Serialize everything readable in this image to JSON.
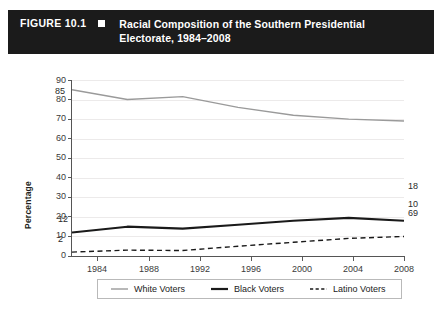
{
  "header": {
    "figure_number": "FIGURE 10.1",
    "bullet_icon": "square-bullet-icon",
    "title_line1": "Racial Composition of the Southern Presidential",
    "title_line2": "Electorate, 1984–2008",
    "bar_color": "#1b1b1b",
    "text_color": "#ffffff"
  },
  "chart_data": {
    "type": "line",
    "title": "Racial Composition of the Southern Presidential Electorate, 1984–2008",
    "xlabel": "",
    "ylabel": "Percentage",
    "x": [
      "1984",
      "1988",
      "1992",
      "1996",
      "2000",
      "2004",
      "2008"
    ],
    "categories": [
      "1984",
      "1988",
      "1992",
      "1996",
      "2000",
      "2004",
      "2008"
    ],
    "ylim": [
      0,
      90
    ],
    "yticks": [
      0,
      10,
      20,
      30,
      40,
      50,
      60,
      70,
      80,
      90
    ],
    "grid": true,
    "legend_position": "bottom",
    "series": [
      {
        "name": "White Voters",
        "values": [
          85,
          80,
          81.5,
          76,
          72,
          70,
          69
        ],
        "color": "#9a9a9a",
        "style": "solid",
        "width": 1.4,
        "point_labels": {
          "1984": "85",
          "2008": "69"
        }
      },
      {
        "name": "Black Voters",
        "values": [
          12,
          15,
          14,
          16,
          18,
          19.5,
          18
        ],
        "color": "#1a1a1a",
        "style": "solid",
        "width": 2.1,
        "point_labels": {
          "1984": "12",
          "2008": "18"
        }
      },
      {
        "name": "Latino Voters",
        "values": [
          2,
          3,
          2.8,
          5,
          7,
          9,
          10
        ],
        "color": "#1a1a1a",
        "style": "dashed",
        "width": 1.4,
        "point_labels": {
          "1984": "2",
          "2008": "10"
        }
      }
    ],
    "annotations": [
      {
        "text": "85",
        "series": "White Voters",
        "x": "1984"
      },
      {
        "text": "69",
        "series": "White Voters",
        "x": "2008"
      },
      {
        "text": "12",
        "series": "Black Voters",
        "x": "1984"
      },
      {
        "text": "18",
        "series": "Black Voters",
        "x": "2008"
      },
      {
        "text": "2",
        "series": "Latino Voters",
        "x": "1984"
      },
      {
        "text": "10",
        "series": "Latino Voters",
        "x": "2008"
      }
    ]
  },
  "axis": {
    "y_labels": [
      "90",
      "80",
      "70",
      "60",
      "50",
      "40",
      "30",
      "20",
      "10",
      "0"
    ],
    "y_title": "Percentage",
    "x_labels": [
      "1984",
      "1988",
      "1992",
      "1996",
      "2000",
      "2004",
      "2008"
    ]
  },
  "legend": {
    "items": [
      {
        "label": "White Voters",
        "style": "solid-gray"
      },
      {
        "label": "Black Voters",
        "style": "solid-black-thick"
      },
      {
        "label": "Latino Voters",
        "style": "dashed-black"
      }
    ]
  },
  "point_labels": {
    "white_start": "85",
    "white_end": "69",
    "black_start": "12",
    "black_end": "18",
    "latino_start": "2",
    "latino_end": "10"
  }
}
